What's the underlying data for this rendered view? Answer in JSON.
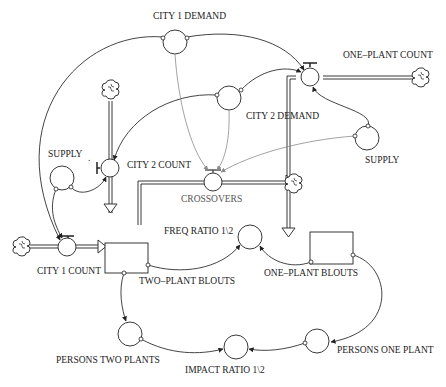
{
  "diagram": {
    "type": "stock-and-flow",
    "colors": {
      "line": "#222222",
      "grey_link": "#8a8a8a",
      "background": "#ffffff"
    },
    "stocks": [
      {
        "id": "two_plant_blouts",
        "label": "TWO–PLANT BLOUTS"
      },
      {
        "id": "one_plant_blouts",
        "label": "ONE–PLANT BLOUTS"
      }
    ],
    "flows": [
      {
        "id": "city1_count",
        "label": "CITY 1 COUNT"
      },
      {
        "id": "city2_count",
        "label": "CITY 2 COUNT"
      },
      {
        "id": "one_plant_count",
        "label": "ONE–PLANT COUNT"
      },
      {
        "id": "crossovers",
        "label": "CROSSOVERS"
      }
    ],
    "auxiliaries": [
      {
        "id": "city1_demand",
        "label": "CITY 1 DEMAND"
      },
      {
        "id": "city2_demand",
        "label": "CITY 2 DEMAND"
      },
      {
        "id": "supply_left",
        "label": "SUPPLY"
      },
      {
        "id": "supply_right",
        "label": "SUPPLY"
      },
      {
        "id": "freq_ratio",
        "label": "FREQ RATIO 1\\2"
      },
      {
        "id": "persons_two_plants",
        "label": "PERSONS TWO PLANTS"
      },
      {
        "id": "persons_one_plant",
        "label": "PERSONS ONE PLANT"
      },
      {
        "id": "impact_ratio",
        "label": "IMPACT RATIO 1\\2"
      }
    ],
    "supply_dot": "."
  }
}
